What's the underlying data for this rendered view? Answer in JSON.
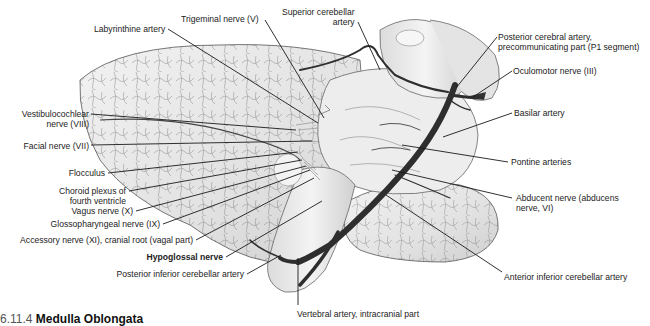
{
  "figure": {
    "caption_partial": {
      "number": "6.11.4",
      "title": "Medulla Oblongata"
    },
    "colors": {
      "background": "#ffffff",
      "tissue": "#e9e9e9",
      "vessel": "#2e2e2e",
      "leader": "#1a1a1a",
      "text": "#222222"
    }
  },
  "labels": [
    {
      "id": "labyrinthine-artery",
      "text": "Labyrinthine artery",
      "x": 94,
      "y": 24,
      "align": "left",
      "line": [
        [
          168,
          29
        ],
        [
          318,
          123
        ]
      ]
    },
    {
      "id": "trigeminal-nerve",
      "text": "Trigeminal nerve (V)",
      "x": 181,
      "y": 14,
      "align": "left",
      "line": [
        [
          265,
          20
        ],
        [
          324,
          118
        ]
      ]
    },
    {
      "id": "superior-cerebellar-artery",
      "text": [
        "Superior cerebellar",
        "artery"
      ],
      "x": 282,
      "y": 7,
      "align": "right",
      "line": [
        [
          358,
          22
        ],
        [
          380,
          70
        ]
      ]
    },
    {
      "id": "posterior-cerebral-artery",
      "text": [
        "Posterior cerebral artery,",
        "precommunicating part (P1 segment)"
      ],
      "x": 498,
      "y": 32,
      "align": "left",
      "line": [
        [
          497,
          37
        ],
        [
          456,
          88
        ]
      ]
    },
    {
      "id": "oculomotor-nerve",
      "text": "Oculomotor nerve (III)",
      "x": 513,
      "y": 66,
      "align": "left",
      "line": [
        [
          512,
          71
        ],
        [
          473,
          97
        ]
      ]
    },
    {
      "id": "basilar-artery",
      "text": "Basilar artery",
      "x": 514,
      "y": 108,
      "align": "left",
      "line": [
        [
          512,
          113
        ],
        [
          443,
          137
        ]
      ]
    },
    {
      "id": "pontine-arteries",
      "text": "Pontine arteries",
      "x": 511,
      "y": 157,
      "align": "left",
      "line": [
        [
          508,
          162
        ],
        [
          402,
          145
        ]
      ]
    },
    {
      "id": "abducent-nerve",
      "text": [
        "Abducent nerve (abducens",
        "nerve, VI)"
      ],
      "x": 516,
      "y": 193,
      "align": "left",
      "line": [
        [
          512,
          198
        ],
        [
          392,
          170
        ]
      ]
    },
    {
      "id": "anterior-inferior-cerebellar-artery",
      "text": "Anterior inferior cerebellar artery",
      "x": 504,
      "y": 272,
      "align": "left",
      "line": [
        [
          502,
          272
        ],
        [
          386,
          195
        ]
      ]
    },
    {
      "id": "vertebral-artery",
      "text": "Vertebral artery, intracranial part",
      "x": 297,
      "y": 309,
      "align": "left",
      "line": [
        [
          298,
          305
        ],
        [
          298,
          258
        ]
      ]
    },
    {
      "id": "vestibulocochlear-nerve",
      "text": [
        "Vestibulocochlear",
        "nerve (VIII)"
      ],
      "x": 4,
      "y": 109,
      "align": "right",
      "w": 85,
      "line": [
        [
          91,
          114
        ],
        [
          296,
          130
        ]
      ]
    },
    {
      "id": "facial-nerve",
      "text": "Facial nerve (VII)",
      "x": 4,
      "y": 141,
      "align": "right",
      "w": 85,
      "line": [
        [
          91,
          145
        ],
        [
          312,
          141
        ]
      ]
    },
    {
      "id": "flocculus",
      "text": "Flocculus",
      "x": 4,
      "y": 168,
      "align": "right",
      "w": 101,
      "line": [
        [
          108,
          173
        ],
        [
          298,
          152
        ]
      ]
    },
    {
      "id": "choroid-plexus",
      "text": [
        "Choroid plexus of",
        "fourth ventricle"
      ],
      "x": 4,
      "y": 186,
      "align": "right",
      "w": 122,
      "line": [
        [
          129,
          191
        ],
        [
          302,
          160
        ]
      ]
    },
    {
      "id": "vagus-nerve",
      "text": "Vagus nerve (X)",
      "x": 4,
      "y": 206,
      "align": "right",
      "w": 129,
      "line": [
        [
          136,
          211
        ],
        [
          306,
          166
        ]
      ]
    },
    {
      "id": "glossopharyngeal-nerve",
      "text": "Glossopharyngeal nerve (IX)",
      "x": 4,
      "y": 219,
      "align": "right",
      "w": 156,
      "line": [
        [
          163,
          224
        ],
        [
          310,
          170
        ]
      ]
    },
    {
      "id": "accessory-nerve",
      "text": "Accessory nerve (XI), cranial root (vagal part)",
      "x": 4,
      "y": 235,
      "align": "right",
      "w": 189,
      "line": [
        [
          196,
          240
        ],
        [
          314,
          178
        ]
      ]
    },
    {
      "id": "hypoglossal-nerve",
      "text": "Hypoglossal nerve",
      "x": 4,
      "y": 252,
      "align": "right",
      "w": 219,
      "bold": true,
      "line": [
        [
          226,
          257
        ],
        [
          322,
          201
        ]
      ]
    },
    {
      "id": "posterior-inferior-cerebellar-artery",
      "text": "Posterior inferior cerebellar artery",
      "x": 4,
      "y": 269,
      "align": "right",
      "w": 240,
      "line": [
        [
          247,
          274
        ],
        [
          281,
          255
        ]
      ]
    }
  ]
}
